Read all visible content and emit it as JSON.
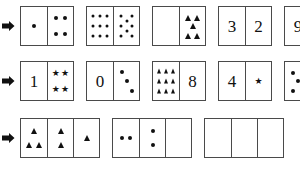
{
  "worksheet": {
    "title": "Domino and tile pattern worksheet",
    "background_color": "#ffffff",
    "ink_color": "#111111",
    "border_color": "#4a4a4a",
    "row_marker": "right-arrow",
    "rows": [
      {
        "marker": "➤",
        "cards": [
          {
            "card_label": "card-1-1",
            "cells": [
              {
                "kind": "pips",
                "count": 1,
                "layout": "center"
              },
              {
                "kind": "pips",
                "count": 4,
                "layout": "corners"
              }
            ]
          },
          {
            "card_label": "card-1-2",
            "cells": [
              {
                "kind": "pips",
                "count": 9,
                "layout": "grid3x3"
              },
              {
                "kind": "pips",
                "count": 8,
                "layout": "grid-ring"
              }
            ]
          },
          {
            "card_label": "card-1-3",
            "cells": [
              {
                "kind": "empty",
                "count": 0,
                "layout": "none"
              },
              {
                "kind": "triangles",
                "count": 5,
                "layout": "quincunx"
              }
            ]
          },
          {
            "card_label": "card-1-4",
            "cells": [
              {
                "kind": "numeral",
                "value": "3"
              },
              {
                "kind": "numeral",
                "value": "2"
              }
            ]
          },
          {
            "card_label": "card-1-5",
            "cells": [
              {
                "kind": "numeral",
                "value": "9"
              },
              {
                "kind": "numeral",
                "value": "2"
              }
            ]
          }
        ]
      },
      {
        "marker": "➤",
        "cards": [
          {
            "card_label": "card-2-1",
            "cells": [
              {
                "kind": "numeral",
                "value": "1"
              },
              {
                "kind": "stars",
                "count": 4,
                "layout": "corners"
              }
            ]
          },
          {
            "card_label": "card-2-2",
            "cells": [
              {
                "kind": "numeral",
                "value": "0"
              },
              {
                "kind": "pips",
                "count": 3,
                "layout": "diagonal"
              }
            ]
          },
          {
            "card_label": "card-2-3",
            "cells": [
              {
                "kind": "triangles",
                "count": 9,
                "layout": "grid3x3"
              },
              {
                "kind": "numeral",
                "value": "8"
              }
            ]
          },
          {
            "card_label": "card-2-4",
            "cells": [
              {
                "kind": "numeral",
                "value": "4"
              },
              {
                "kind": "stars",
                "count": 1,
                "layout": "center"
              }
            ]
          },
          {
            "card_label": "card-2-5",
            "cells": [
              {
                "kind": "pips",
                "count": 5,
                "layout": "quincunx"
              },
              {
                "kind": "numeral",
                "value": "1"
              }
            ]
          }
        ]
      },
      {
        "marker": "➤",
        "cards": [
          {
            "card_label": "card-3-1",
            "cells": [
              {
                "kind": "triangles",
                "count": 3,
                "layout": "triad"
              },
              {
                "kind": "triangles",
                "count": 2,
                "layout": "pair-v"
              },
              {
                "kind": "triangles",
                "count": 1,
                "layout": "center"
              }
            ]
          },
          {
            "card_label": "card-3-2",
            "cells": [
              {
                "kind": "pips",
                "count": 2,
                "layout": "pair-h"
              },
              {
                "kind": "pips",
                "count": 2,
                "layout": "pair-v"
              },
              {
                "kind": "empty",
                "count": 0,
                "layout": "none"
              }
            ]
          },
          {
            "card_label": "card-3-3",
            "cells": [
              {
                "kind": "empty",
                "count": 0,
                "layout": "none"
              },
              {
                "kind": "empty",
                "count": 0,
                "layout": "none"
              },
              {
                "kind": "empty",
                "count": 0,
                "layout": "none"
              }
            ]
          }
        ]
      }
    ]
  }
}
